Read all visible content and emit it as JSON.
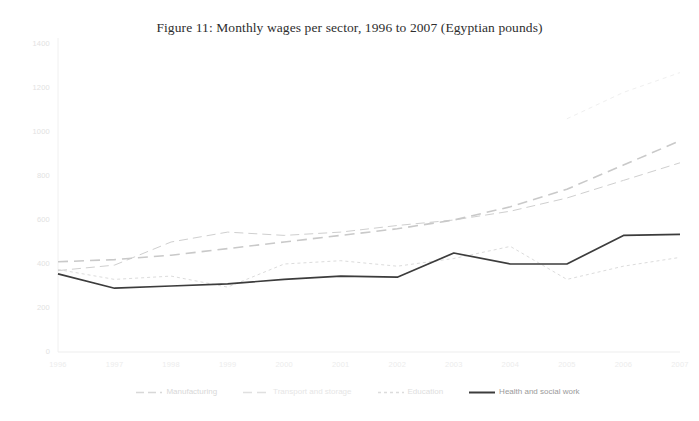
{
  "figure": {
    "title": "Figure 11: Monthly wages per sector, 1996 to 2007 (Egyptian pounds)"
  },
  "chart_data": {
    "type": "line",
    "title": "Figure 11: Monthly wages per sector, 1996 to 2007 (Egyptian pounds)",
    "xlabel": "",
    "ylabel": "",
    "ylim": [
      0,
      1400
    ],
    "ytick_labels": [
      "1400",
      "1200",
      "1000",
      "800",
      "600",
      "400",
      "200",
      "0"
    ],
    "ytick_values": [
      1400,
      1200,
      1000,
      800,
      600,
      400,
      200,
      0
    ],
    "grid": false,
    "legend_position": "bottom",
    "x": [
      1996,
      1997,
      1998,
      1999,
      2000,
      2001,
      2002,
      2003,
      2004,
      2005,
      2006,
      2007
    ],
    "categories": [
      "1996",
      "1997",
      "1998",
      "1999",
      "2000",
      "2001",
      "2002",
      "2003",
      "2004",
      "2005",
      "2006",
      "2007"
    ],
    "series": [
      {
        "name": "Manufacturing",
        "color": "#cfcfcf",
        "style": "long-dash-faint",
        "values": [
          370,
          395,
          500,
          545,
          530,
          545,
          575,
          600,
          640,
          700,
          780,
          860
        ]
      },
      {
        "name": "Transport and storage",
        "color": "#c9c9c9",
        "style": "long-dash",
        "values": [
          410,
          420,
          440,
          470,
          500,
          530,
          560,
          600,
          660,
          740,
          850,
          960
        ]
      },
      {
        "name": "Education",
        "color": "#dcdcdc",
        "style": "short-dash",
        "values": [
          375,
          330,
          345,
          295,
          400,
          415,
          390,
          425,
          480,
          330,
          390,
          430
        ]
      },
      {
        "name": "Health and social work",
        "color": "#3c3c3c",
        "style": "solid",
        "values": [
          355,
          290,
          300,
          310,
          330,
          345,
          340,
          450,
          400,
          400,
          530,
          535
        ]
      }
    ],
    "education_upper_tail": {
      "comment_visible_in_pixels": false,
      "values": [
        null,
        null,
        null,
        null,
        null,
        null,
        null,
        null,
        null,
        1060,
        1180,
        1270
      ]
    }
  },
  "legend": {
    "items": [
      {
        "label": "Manufacturing",
        "color": "#d8d8d8",
        "dash": "8,4"
      },
      {
        "label": "Transport and storage",
        "color": "#e0e0e0",
        "dash": "9,5"
      },
      {
        "label": "Education",
        "color": "#dcdcdc",
        "dash": "3,3"
      },
      {
        "label": "Health and social work",
        "color": "#3c3c3c",
        "dash": "none"
      }
    ]
  }
}
